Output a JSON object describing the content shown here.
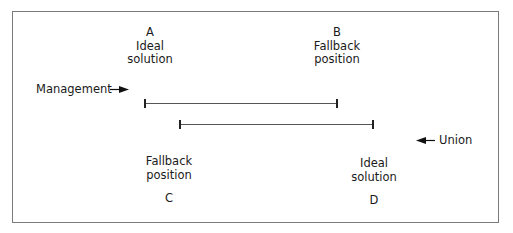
{
  "diagram": {
    "type": "negotiation-range",
    "points": {
      "A": {
        "letter": "A",
        "line1": "Ideal",
        "line2": "solution"
      },
      "B": {
        "letter": "B",
        "line1": "Fallback",
        "line2": "position"
      },
      "C": {
        "letter": "C",
        "line1": "Fallback",
        "line2": "position"
      },
      "D": {
        "letter": "D",
        "line1": "Ideal",
        "line2": "solution"
      }
    },
    "parties": {
      "management": {
        "label": "Management",
        "arrow_direction": "right"
      },
      "union": {
        "label": "Union",
        "arrow_direction": "left"
      }
    },
    "ranges": [
      {
        "party": "Management",
        "from": "A",
        "to": "B"
      },
      {
        "party": "Union",
        "from": "C",
        "to": "D"
      }
    ]
  }
}
